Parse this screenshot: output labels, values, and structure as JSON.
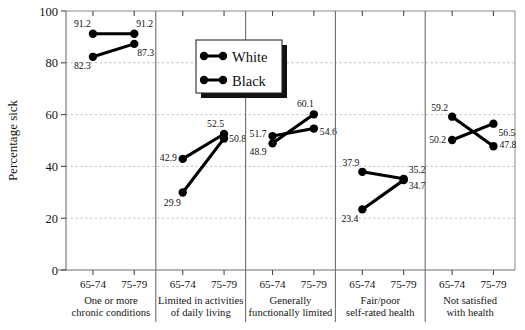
{
  "chart_data": {
    "type": "line",
    "title": "",
    "subtitle": "",
    "xlabel": "",
    "ylabel": "Percentage sick",
    "ylim": [
      0,
      100
    ],
    "yticks": [
      0,
      20,
      40,
      60,
      80,
      100
    ],
    "ytick_labels": [
      "0",
      "20",
      "40",
      "60",
      "80",
      "100"
    ],
    "grid": "horizontal dashed gridlines at 20, 40, 60, 80",
    "legend_position": "upper center (inside plot, over panel 2-3 boundary)",
    "x": [
      "65-74",
      "75-79"
    ],
    "xtick_labels": [
      "65-74",
      "75-79"
    ],
    "panels": [
      {
        "name": "panel-chronic-conditions",
        "label_line1": "One or more",
        "label_line2": "chronic conditions",
        "series": [
          {
            "name": "White",
            "values": [
              91.2,
              91.2
            ],
            "labels": [
              "91.2",
              "91.2"
            ]
          },
          {
            "name": "Black",
            "values": [
              82.3,
              87.3
            ],
            "labels": [
              "82.3",
              "87.3"
            ]
          }
        ]
      },
      {
        "name": "panel-limited-daily-living",
        "label_line1": "Limited in activities",
        "label_line2": "of daily living",
        "series": [
          {
            "name": "White",
            "values": [
              42.9,
              52.5
            ],
            "labels": [
              "42.9",
              "52.5"
            ]
          },
          {
            "name": "Black",
            "values": [
              29.9,
              50.8
            ],
            "labels": [
              "29.9",
              "50.8"
            ]
          }
        ]
      },
      {
        "name": "panel-functionally-limited",
        "label_line1": "Generally",
        "label_line2": "functionally limited",
        "series": [
          {
            "name": "White",
            "values": [
              51.7,
              54.6
            ],
            "labels": [
              "51.7",
              "54.6"
            ]
          },
          {
            "name": "Black",
            "values": [
              48.9,
              60.1
            ],
            "labels": [
              "48.9",
              "60.1"
            ]
          }
        ]
      },
      {
        "name": "panel-self-rated-health",
        "label_line1": "Fair/poor",
        "label_line2": "self-rated health",
        "series": [
          {
            "name": "White",
            "values": [
              37.9,
              35.2
            ],
            "labels": [
              "37.9",
              "35.2"
            ]
          },
          {
            "name": "Black",
            "values": [
              23.4,
              34.7
            ],
            "labels": [
              "23.4",
              "34.7"
            ]
          }
        ]
      },
      {
        "name": "panel-not-satisfied",
        "label_line1": "Not satisfied",
        "label_line2": "with health",
        "series": [
          {
            "name": "White",
            "values": [
              59.2,
              47.8
            ],
            "labels": [
              "59.2",
              "47.8"
            ]
          },
          {
            "name": "Black",
            "values": [
              50.2,
              56.5
            ],
            "labels": [
              "50.2",
              "56.5"
            ]
          }
        ]
      }
    ],
    "legend": [
      {
        "name": "White",
        "label": "White",
        "color": "#000000"
      },
      {
        "name": "Black",
        "label": "Black",
        "color": "#000000"
      }
    ],
    "colors": {
      "series": "#000000",
      "axis": "#6d6d6d",
      "grid": "#b9b9b9",
      "text": "#141414",
      "background": "#ffffff"
    }
  }
}
